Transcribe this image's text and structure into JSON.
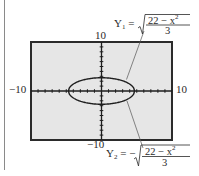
{
  "chart_data": {
    "type": "line",
    "title": "",
    "xlim": [
      -10,
      10
    ],
    "ylim": [
      -10,
      10
    ],
    "xscale": 1,
    "yscale": 1,
    "grid": false,
    "tick_labels": {
      "x_min": "−10",
      "x_max": "10",
      "y_min": "−10",
      "y_max": "10"
    },
    "series": [
      {
        "name": "Y1",
        "equation": "Y1 = sqrt((22 - x^2)/3)",
        "x": [
          -4.69,
          -4,
          -3,
          -2,
          -1,
          0,
          1,
          2,
          3,
          4,
          4.69
        ],
        "y": [
          0,
          1.41,
          2.08,
          2.45,
          2.65,
          2.71,
          2.65,
          2.45,
          2.08,
          1.41,
          0
        ]
      },
      {
        "name": "Y2",
        "equation": "Y2 = -sqrt((22 - x^2)/3)",
        "x": [
          -4.69,
          -4,
          -3,
          -2,
          -1,
          0,
          1,
          2,
          3,
          4,
          4.69
        ],
        "y": [
          0,
          -1.41,
          -2.08,
          -2.45,
          -2.65,
          -2.71,
          -2.65,
          -2.45,
          -2.08,
          -1.41,
          0
        ]
      }
    ],
    "annotations": [
      {
        "label": "Y1 = √((22 − x²)/3)",
        "points_to": "upper half of ellipse"
      },
      {
        "label": "Y2 = −√((22 − x²)/3)",
        "points_to": "lower half of ellipse"
      }
    ]
  },
  "labels": {
    "y_max": "10",
    "y_min": "−10",
    "x_min": "−10",
    "x_max": "10",
    "y1_name": "Y",
    "y1_sub": "1",
    "y1_eq": "=",
    "y2_name": "Y",
    "y2_sub": "2",
    "y2_eq": "= −",
    "numerator": "22 − x",
    "numerator_exp": "2",
    "denominator": "3"
  },
  "colors": {
    "window_fill": "#e6e6e6",
    "frame": "#2b2b2b",
    "curve": "#1e1e1e",
    "leader": "#555555",
    "margin_rule": "#8a8a8a"
  }
}
